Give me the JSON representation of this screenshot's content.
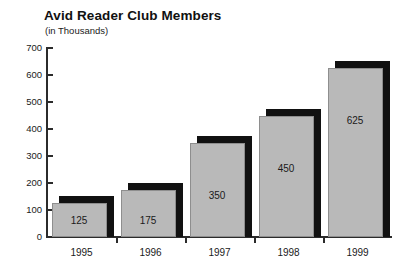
{
  "chart_data": {
    "type": "bar",
    "title": "Avid Reader Club Members",
    "subtitle": "(in Thousands)",
    "xlabel": "",
    "ylabel": "",
    "categories": [
      "1995",
      "1996",
      "1997",
      "1998",
      "1999"
    ],
    "values": [
      125,
      175,
      350,
      450,
      625
    ],
    "value_labels": [
      "125",
      "175",
      "350",
      "450",
      "625"
    ],
    "ylim": [
      0,
      700
    ],
    "yticks": [
      0,
      100,
      200,
      300,
      400,
      500,
      600,
      700
    ],
    "ytick_labels": [
      "0",
      "100",
      "200",
      "300",
      "400",
      "500",
      "600",
      "700"
    ],
    "grid": false,
    "legend": false,
    "bar_color": "#b9b9b9",
    "bar_shadow_color": "#111111",
    "axis_color": "#2b2b2b",
    "background": "#ffffff"
  }
}
